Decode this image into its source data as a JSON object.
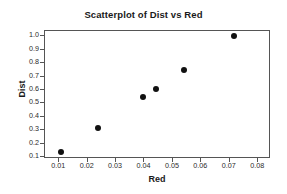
{
  "chart_data": {
    "type": "scatter",
    "title": "Scatterplot of Dist vs Red",
    "xlabel": "Red",
    "ylabel": "Dist",
    "xlim": [
      0.005,
      0.0845
    ],
    "ylim": [
      0.085,
      1.04
    ],
    "grid": false,
    "legend": null,
    "xticks": [
      0.01,
      0.02,
      0.03,
      0.04,
      0.05,
      0.06,
      0.07,
      0.08
    ],
    "xtick_labels": [
      "0.01",
      "0.02",
      "0.03",
      "0.04",
      "0.05",
      "0.06",
      "0.07",
      "0.08"
    ],
    "yticks": [
      0.1,
      0.2,
      0.3,
      0.4,
      0.5,
      0.6,
      0.7,
      0.8,
      0.9,
      1.0
    ],
    "ytick_labels": [
      "0.1",
      "0.2",
      "0.3",
      "0.4",
      "0.5",
      "0.6",
      "0.7",
      "0.8",
      "0.9",
      "1.0"
    ],
    "marker": "filled-circle",
    "marker_color": "#111111",
    "points": [
      {
        "x": 0.0105,
        "y": 0.14
      },
      {
        "x": 0.0235,
        "y": 0.32
      },
      {
        "x": 0.0395,
        "y": 0.55
      },
      {
        "x": 0.044,
        "y": 0.61
      },
      {
        "x": 0.054,
        "y": 0.75
      },
      {
        "x": 0.0715,
        "y": 1.0
      }
    ]
  }
}
